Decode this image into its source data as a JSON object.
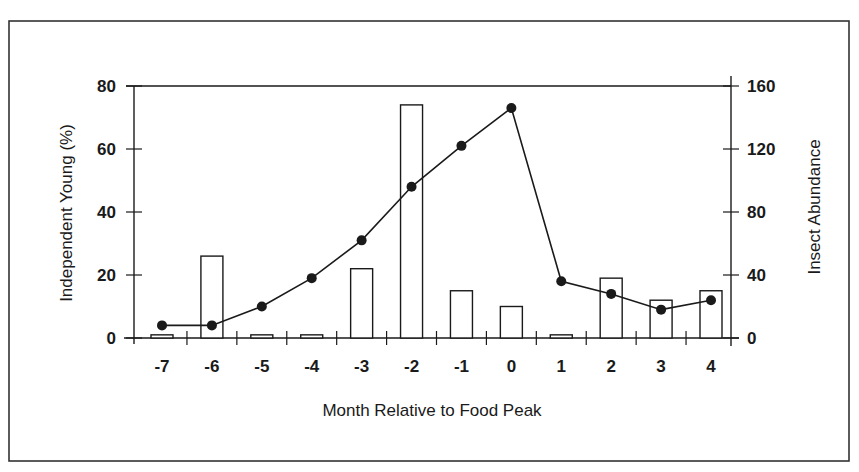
{
  "chart_data": {
    "type": "bar+line",
    "title": "",
    "xlabel": "Month Relative to Food Peak",
    "ylabel": "Independent Young (%)",
    "y2label": "Insect Abundance",
    "categories": [
      "-7",
      "-6",
      "-5",
      "-4",
      "-3",
      "-2",
      "-1",
      "0",
      "1",
      "2",
      "3",
      "4"
    ],
    "series": [
      {
        "name": "Independent Young (%)",
        "type": "bar",
        "axis": "left",
        "values": [
          1,
          26,
          1,
          1,
          22,
          74,
          15,
          10,
          1,
          19,
          12,
          15
        ]
      },
      {
        "name": "Insect Abundance",
        "type": "line",
        "axis": "right",
        "values": [
          8,
          8,
          20,
          38,
          62,
          96,
          122,
          146,
          36,
          28,
          18,
          24
        ]
      }
    ],
    "ylim": [
      0,
      80
    ],
    "y2lim": [
      0,
      160
    ],
    "yticks": [
      "0",
      "20",
      "40",
      "60",
      "80"
    ],
    "y2ticks": [
      "0",
      "40",
      "80",
      "120",
      "160"
    ],
    "grid": false,
    "legend": null,
    "colors": {
      "bar_fill": "#ffffff",
      "bar_stroke": "#1a1a1a",
      "line": "#1a1a1a",
      "marker": "#1a1a1a",
      "axis": "#1a1a1a",
      "frame": "#333333"
    }
  }
}
